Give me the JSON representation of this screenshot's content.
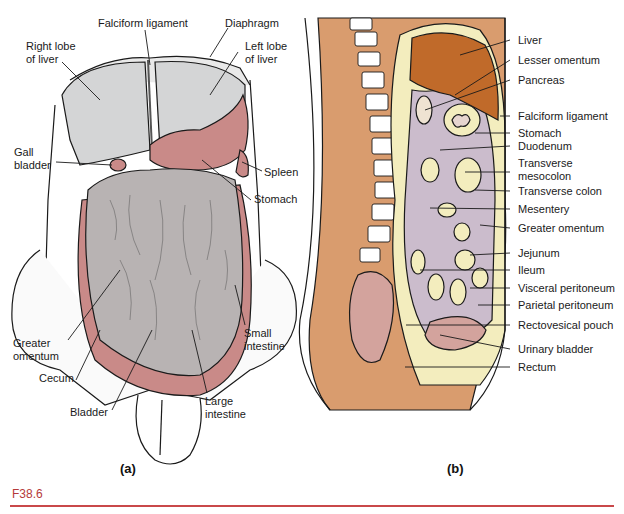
{
  "figure": {
    "caption_id": "F38.6",
    "accent_color": "#c9484a",
    "panels": [
      {
        "id": "a",
        "label": "(a)",
        "description": "Anterior view of abdominal cavity",
        "annotations": [
          {
            "text": "Falciform ligament"
          },
          {
            "text": "Diaphragm"
          },
          {
            "text": "Right lobe\nof liver"
          },
          {
            "text": "Left lobe\nof liver"
          },
          {
            "text": "Gall\nbladder"
          },
          {
            "text": "Spleen"
          },
          {
            "text": "Stomach"
          },
          {
            "text": "Greater\nomentum"
          },
          {
            "text": "Small\nintestine"
          },
          {
            "text": "Cecum"
          },
          {
            "text": "Bladder"
          },
          {
            "text": "Large\nintestine"
          }
        ]
      },
      {
        "id": "b",
        "label": "(b)",
        "description": "Sagittal section of abdominopelvic cavity",
        "annotations": [
          {
            "text": "Liver"
          },
          {
            "text": "Lesser omentum"
          },
          {
            "text": "Pancreas"
          },
          {
            "text": "Falciform ligament"
          },
          {
            "text": "Stomach"
          },
          {
            "text": "Duodenum"
          },
          {
            "text": "Transverse\nmesocolon"
          },
          {
            "text": "Transverse colon"
          },
          {
            "text": "Mesentery"
          },
          {
            "text": "Greater omentum"
          },
          {
            "text": "Jejunum"
          },
          {
            "text": "Ileum"
          },
          {
            "text": "Visceral peritoneum"
          },
          {
            "text": "Parietal peritoneum"
          },
          {
            "text": "Rectovesical pouch"
          },
          {
            "text": "Urinary bladder"
          },
          {
            "text": "Rectum"
          }
        ]
      }
    ]
  },
  "colors": {
    "liver_gray": "#d4d5d6",
    "omentum_gray": "#b8b3b3",
    "stomach_pink": "#c98a88",
    "body_tan": "#d99c6e",
    "liver_brown": "#c06a2a",
    "peritoneum_cream": "#f3edbe",
    "cavity_lavender": "#cbbccc",
    "vertebra_white": "#ffffff"
  }
}
